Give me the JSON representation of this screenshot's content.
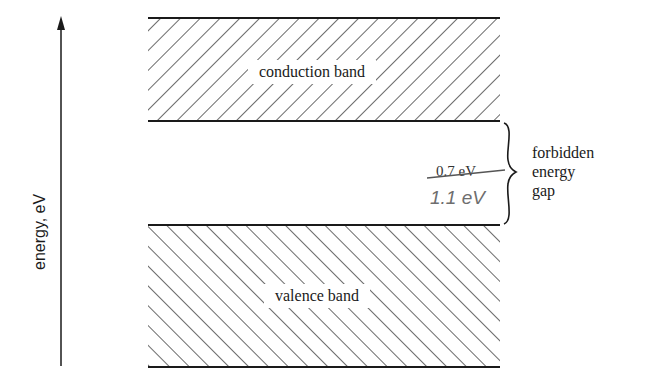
{
  "diagram": {
    "type": "energy-band-diagram",
    "axis": {
      "label": "energy, eV",
      "direction": "up"
    },
    "bands": [
      {
        "id": "conduction",
        "label": "conduction band",
        "hatch": "forward-slash"
      },
      {
        "id": "valence",
        "label": "valence band",
        "hatch": "back-slash"
      }
    ],
    "gap": {
      "label_lines": [
        "forbidden",
        "energy",
        "gap"
      ],
      "value_struck": "0.7 eV",
      "value_handwritten": "1.1 eV"
    },
    "colors": {
      "ink": "#1a1a1a",
      "pencil": "#6e6e6e",
      "background": "#ffffff"
    }
  }
}
